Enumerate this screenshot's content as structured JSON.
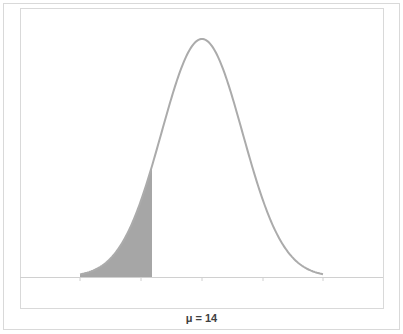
{
  "chart_data": {
    "type": "area",
    "title": "",
    "xlabel": "μ = 14",
    "ylabel": "",
    "distribution": "normal",
    "mean_label": "μ = 14",
    "mu": 14,
    "x_ticks_in_sigma": [
      -3,
      -1.5,
      0,
      1.5,
      3
    ],
    "tick_labels": [],
    "shaded_region": {
      "side": "left",
      "upper_bound_in_sigma": -1.23
    },
    "series": [
      {
        "name": "normal density curve",
        "color": "#ababab"
      },
      {
        "name": "shaded tail",
        "color": "#a6a6a6"
      }
    ],
    "grid": false,
    "legend": null
  },
  "geometry": {
    "baseline_y": 277,
    "peak_y": 39,
    "center_x": 202,
    "sigma_px": 40.5,
    "tail_left_x": 80,
    "tail_right_x": 323,
    "shade_end_x": 152,
    "axis_left_x": 20,
    "axis_right_x": 383,
    "tick_xs": [
      80,
      141,
      202,
      263,
      323
    ]
  },
  "colors": {
    "curve": "#ababab",
    "shade": "#a6a6a6",
    "axis": "#d0d0d0",
    "border": "#d9d9d9",
    "label": "#404040"
  }
}
